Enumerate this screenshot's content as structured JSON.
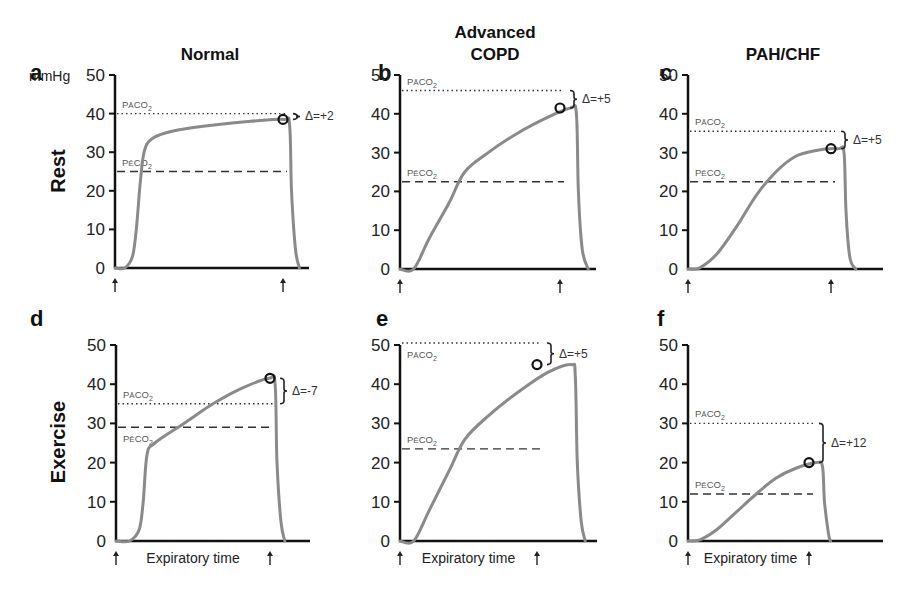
{
  "figure": {
    "unit_label": "mmHg",
    "row_labels": [
      "Rest",
      "Exercise"
    ],
    "xlabel": "Expiratory time",
    "pa_label": "PaCO2",
    "pe_label": "PĒCO2"
  },
  "chart_data": [
    {
      "type": "line",
      "panel": "a",
      "title": "Normal",
      "row": "Rest",
      "ylabel": "mmHg",
      "xlabel": "",
      "ylim": [
        0,
        50
      ],
      "yticks": [
        0,
        10,
        20,
        30,
        40,
        50
      ],
      "PaCO2": 40,
      "PeCO2": 25,
      "end_tidal": 38.5,
      "delta_label": "Δ=+2",
      "curve": [
        [
          0,
          0
        ],
        [
          0.05,
          0
        ],
        [
          0.09,
          3
        ],
        [
          0.11,
          10
        ],
        [
          0.13,
          22
        ],
        [
          0.15,
          30
        ],
        [
          0.19,
          33.5
        ],
        [
          0.3,
          35.5
        ],
        [
          0.5,
          37
        ],
        [
          0.7,
          38
        ],
        [
          0.87,
          38.5
        ],
        [
          0.9,
          37
        ],
        [
          0.91,
          20
        ],
        [
          0.93,
          5
        ],
        [
          0.95,
          0
        ]
      ]
    },
    {
      "type": "line",
      "panel": "b",
      "title": "Advanced COPD",
      "row": "Rest",
      "ylabel": "",
      "xlabel": "",
      "ylim": [
        0,
        50
      ],
      "yticks": [
        0,
        10,
        20,
        30,
        40,
        50
      ],
      "PaCO2": 46,
      "PeCO2": 22.5,
      "end_tidal": 41.5,
      "delta_label": "Δ=+5",
      "curve": [
        [
          0,
          0
        ],
        [
          0.07,
          0
        ],
        [
          0.15,
          8
        ],
        [
          0.25,
          17
        ],
        [
          0.33,
          25
        ],
        [
          0.45,
          30
        ],
        [
          0.6,
          35
        ],
        [
          0.75,
          39
        ],
        [
          0.87,
          41.5
        ],
        [
          0.9,
          40
        ],
        [
          0.91,
          20
        ],
        [
          0.93,
          5
        ],
        [
          0.96,
          0
        ]
      ]
    },
    {
      "type": "line",
      "panel": "c",
      "title": "PAH/CHF",
      "row": "Rest",
      "ylabel": "",
      "xlabel": "",
      "ylim": [
        0,
        50
      ],
      "yticks": [
        0,
        10,
        20,
        30,
        40,
        50
      ],
      "PaCO2": 35.5,
      "PeCO2": 22.5,
      "end_tidal": 31,
      "delta_label": "Δ=+5",
      "curve": [
        [
          0,
          0
        ],
        [
          0.06,
          0.3
        ],
        [
          0.15,
          4
        ],
        [
          0.25,
          11
        ],
        [
          0.35,
          19
        ],
        [
          0.45,
          25
        ],
        [
          0.55,
          29
        ],
        [
          0.65,
          30.5
        ],
        [
          0.77,
          31
        ],
        [
          0.8,
          30
        ],
        [
          0.81,
          15
        ],
        [
          0.83,
          3
        ],
        [
          0.86,
          0
        ]
      ]
    },
    {
      "type": "line",
      "panel": "d",
      "title": "",
      "row": "Exercise",
      "ylabel": "",
      "xlabel": "Expiratory time",
      "ylim": [
        0,
        50
      ],
      "yticks": [
        0,
        10,
        20,
        30,
        40,
        50
      ],
      "PaCO2": 35,
      "PeCO2": 29,
      "end_tidal": 41.5,
      "delta_label": "Δ=-7",
      "curve": [
        [
          0,
          0
        ],
        [
          0.07,
          0
        ],
        [
          0.12,
          3
        ],
        [
          0.14,
          10
        ],
        [
          0.16,
          22
        ],
        [
          0.2,
          25
        ],
        [
          0.35,
          30
        ],
        [
          0.5,
          35
        ],
        [
          0.65,
          39
        ],
        [
          0.79,
          41.5
        ],
        [
          0.82,
          40
        ],
        [
          0.83,
          20
        ],
        [
          0.85,
          5
        ],
        [
          0.87,
          0
        ]
      ]
    },
    {
      "type": "line",
      "panel": "e",
      "title": "",
      "row": "Exercise",
      "ylabel": "",
      "xlabel": "Expiratory time",
      "ylim": [
        0,
        50
      ],
      "yticks": [
        0,
        10,
        20,
        30,
        40,
        50
      ],
      "PaCO2": 50.5,
      "PeCO2": 23.5,
      "end_tidal": 45,
      "delta_label": "Δ=+5",
      "curve": [
        [
          0,
          0
        ],
        [
          0.07,
          0
        ],
        [
          0.15,
          8
        ],
        [
          0.25,
          18
        ],
        [
          0.33,
          26
        ],
        [
          0.45,
          32
        ],
        [
          0.6,
          38
        ],
        [
          0.75,
          43
        ],
        [
          0.87,
          45
        ],
        [
          0.89,
          42
        ],
        [
          0.9,
          20
        ],
        [
          0.92,
          5
        ],
        [
          0.94,
          0
        ]
      ]
    },
    {
      "type": "line",
      "panel": "f",
      "title": "",
      "row": "Exercise",
      "ylabel": "",
      "xlabel": "Expiratory time",
      "ylim": [
        0,
        50
      ],
      "yticks": [
        0,
        10,
        20,
        30,
        40,
        50
      ],
      "PaCO2": 30,
      "PeCO2": 12,
      "end_tidal": 20,
      "delta_label": "Δ=+12",
      "curve": [
        [
          0,
          0
        ],
        [
          0.06,
          0.3
        ],
        [
          0.15,
          3
        ],
        [
          0.25,
          7.5
        ],
        [
          0.35,
          12
        ],
        [
          0.45,
          16
        ],
        [
          0.55,
          18.5
        ],
        [
          0.66,
          20
        ],
        [
          0.69,
          19
        ],
        [
          0.7,
          10
        ],
        [
          0.72,
          2
        ],
        [
          0.73,
          0
        ]
      ]
    }
  ]
}
